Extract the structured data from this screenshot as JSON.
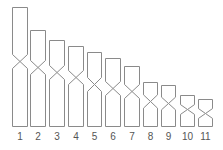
{
  "diagram": {
    "type": "karyotype-ideogram",
    "stroke_color": "#8a8a8a",
    "label_color": "#555555",
    "baseline_y": 126,
    "label_y": 140,
    "chromosomes": [
      {
        "label": "1",
        "x": 12,
        "w": 15,
        "top": 7,
        "cen": 61
      },
      {
        "label": "2",
        "x": 30,
        "w": 15,
        "top": 30,
        "cen": 67
      },
      {
        "label": "3",
        "x": 49,
        "w": 15,
        "top": 40,
        "cen": 72
      },
      {
        "label": "4",
        "x": 68,
        "w": 15,
        "top": 46,
        "cen": 77
      },
      {
        "label": "5",
        "x": 87,
        "w": 14,
        "top": 52,
        "cen": 84
      },
      {
        "label": "6",
        "x": 105,
        "w": 15,
        "top": 58,
        "cen": 88
      },
      {
        "label": "7",
        "x": 124,
        "w": 15,
        "top": 66,
        "cen": 91
      },
      {
        "label": "8",
        "x": 143,
        "w": 14,
        "top": 82,
        "cen": 101
      },
      {
        "label": "9",
        "x": 161,
        "w": 14,
        "top": 85,
        "cen": 103
      },
      {
        "label": "10",
        "x": 180,
        "w": 14,
        "top": 95,
        "cen": 109
      },
      {
        "label": "11",
        "x": 198,
        "w": 14,
        "top": 99,
        "cen": 113
      }
    ]
  }
}
